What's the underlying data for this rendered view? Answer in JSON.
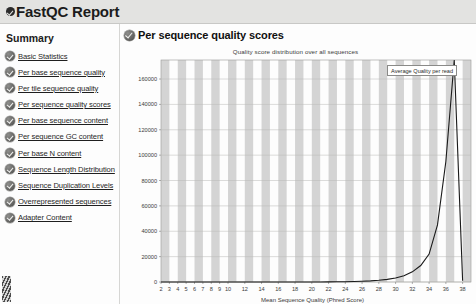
{
  "header": {
    "title": "FastQC Report",
    "logo_icon": "fastqc-tick-logo-icon",
    "background": "#e3e3e1"
  },
  "sidebar": {
    "heading": "Summary",
    "items": [
      {
        "label": "Basic Statistics",
        "icon": "pass-tick-icon"
      },
      {
        "label": "Per base sequence quality",
        "icon": "pass-tick-icon"
      },
      {
        "label": "Per tile sequence quality",
        "icon": "pass-tick-icon"
      },
      {
        "label": "Per sequence quality scores",
        "icon": "pass-tick-icon"
      },
      {
        "label": "Per base sequence content",
        "icon": "pass-tick-icon"
      },
      {
        "label": "Per sequence GC content",
        "icon": "pass-tick-icon"
      },
      {
        "label": "Per base N content",
        "icon": "pass-tick-icon"
      },
      {
        "label": "Sequence Length Distribution",
        "icon": "pass-tick-icon"
      },
      {
        "label": "Sequence Duplication Levels",
        "icon": "pass-tick-icon"
      },
      {
        "label": "Overrepresented sequences",
        "icon": "pass-tick-icon"
      },
      {
        "label": "Adapter Content",
        "icon": "pass-tick-icon"
      }
    ]
  },
  "main": {
    "module_title": "Per sequence quality scores",
    "module_icon": "pass-tick-icon"
  },
  "chart_data": {
    "type": "line",
    "title": "Quality score distribution over all sequences",
    "xlabel": "Mean Sequence Quality (Phred Score)",
    "ylabel": "",
    "legend": [
      "Average Quality per read"
    ],
    "legend_position": "top-right",
    "legend_color": "#000000",
    "grid": true,
    "xlim": [
      2,
      39
    ],
    "ylim": [
      0,
      175000
    ],
    "xticks": [
      2,
      3,
      4,
      5,
      6,
      7,
      8,
      9,
      10,
      12,
      14,
      16,
      18,
      20,
      22,
      24,
      26,
      28,
      30,
      32,
      34,
      36,
      38
    ],
    "yticks": [
      0,
      20000,
      40000,
      60000,
      80000,
      100000,
      120000,
      140000,
      160000
    ],
    "ytick_labels": [
      "0",
      "20000",
      "40000",
      "60000",
      "80000",
      "100000",
      "120000",
      "140000",
      "160000"
    ],
    "band_color": "#d4d4d4",
    "series": [
      {
        "name": "Average Quality per read",
        "color": "#1a1a1a",
        "x": [
          2,
          3,
          4,
          5,
          6,
          7,
          8,
          9,
          10,
          11,
          12,
          13,
          14,
          15,
          16,
          17,
          18,
          19,
          20,
          21,
          22,
          23,
          24,
          25,
          26,
          27,
          28,
          29,
          30,
          31,
          32,
          33,
          34,
          35,
          36,
          37,
          38
        ],
        "values": [
          0,
          0,
          0,
          0,
          0,
          0,
          0,
          0,
          0,
          0,
          0,
          0,
          0,
          0,
          0,
          0,
          0,
          0,
          0,
          0,
          100,
          150,
          250,
          400,
          600,
          900,
          1400,
          2100,
          3200,
          5000,
          8000,
          13000,
          22000,
          45000,
          95000,
          175000,
          1000
        ]
      }
    ]
  }
}
